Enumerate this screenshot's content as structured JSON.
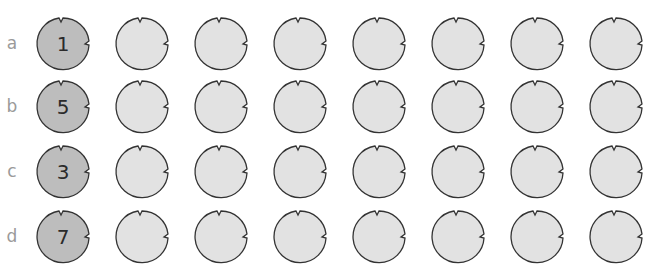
{
  "colors": {
    "numbered_fill": "#bdbdbd",
    "plain_fill": "#e2e2e2",
    "stroke": "#333333",
    "label": "#9a9a9a"
  },
  "rows": [
    {
      "label": "a",
      "number": "1"
    },
    {
      "label": "b",
      "number": "5"
    },
    {
      "label": "c",
      "number": "3"
    },
    {
      "label": "d",
      "number": "7"
    }
  ],
  "columns_per_row": 8
}
